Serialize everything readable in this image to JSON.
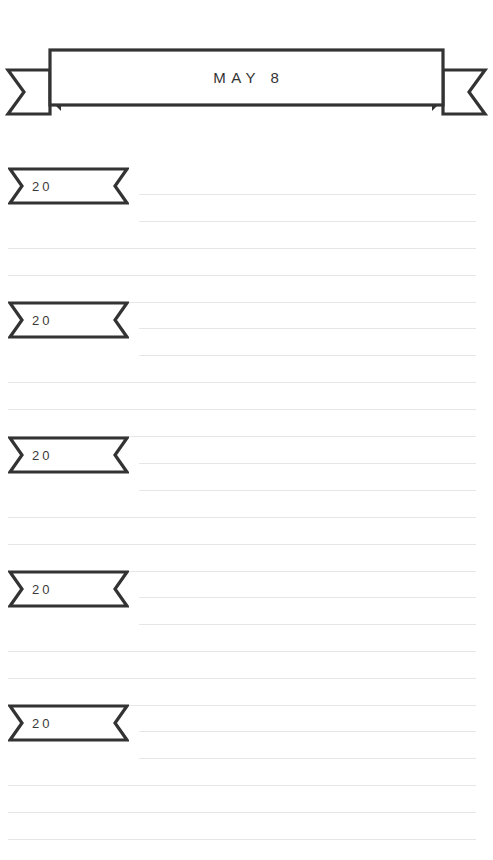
{
  "page": {
    "title": "MAY 8",
    "background_color": "#ffffff",
    "ink_color": "#333333",
    "rule_color": "#e6e6e6"
  },
  "header_banner": {
    "name": "ribbon-banner",
    "label": "MAY 8"
  },
  "entries": [
    {
      "year_label": "20",
      "lines": 5
    },
    {
      "year_label": "20",
      "lines": 5
    },
    {
      "year_label": "20",
      "lines": 5
    },
    {
      "year_label": "20",
      "lines": 5
    },
    {
      "year_label": "20",
      "lines": 5
    }
  ]
}
